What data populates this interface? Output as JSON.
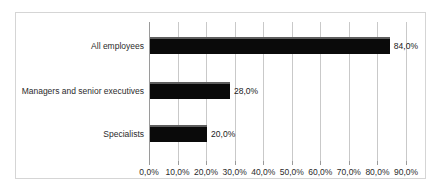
{
  "chart_data": {
    "type": "bar",
    "orientation": "horizontal",
    "title": "",
    "xlabel": "",
    "ylabel": "",
    "categories": [
      "All employees",
      "Managers and senior executives",
      "Specialists"
    ],
    "values": [
      84.0,
      28.0,
      20.0
    ],
    "value_labels": [
      "84,0%",
      "28,0%",
      "20,0%"
    ],
    "xlim": [
      0,
      90
    ],
    "xticks": [
      0,
      10,
      20,
      30,
      40,
      50,
      60,
      70,
      80,
      90
    ],
    "xtick_labels": [
      "0,0%",
      "10,0%",
      "20,0%",
      "30,0%",
      "40,0%",
      "50,0%",
      "60,0%",
      "70,0%",
      "80,0%",
      "90,0%"
    ],
    "grid": true,
    "legend": false,
    "series": [
      {
        "name": "",
        "values": [
          84.0,
          28.0,
          20.0
        ],
        "color": "#0a0a0a"
      }
    ],
    "colors": {
      "bar": "#0a0a0a",
      "bar_highlight": "#5e5e5e",
      "gridline": "#c9c9c9",
      "axis": "#9a9a9a",
      "border": "#d5d5d5",
      "background": "#ffffff",
      "text": "#2b2b2b"
    }
  }
}
